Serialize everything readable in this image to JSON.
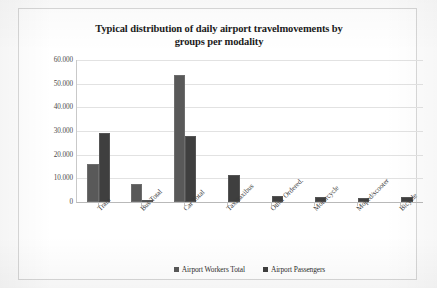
{
  "chart_data": {
    "type": "bar",
    "title": "Typical distribution of daily airport travelmovements by groups per modality",
    "title_line_1": "Typical distribution of daily airport travelmovements by",
    "title_line_2": "groups per modality",
    "xlabel": "",
    "ylabel": "",
    "ylim": [
      0,
      60000
    ],
    "grid": true,
    "legend_position": "bottom",
    "ytick_labels": [
      "0",
      "10.000",
      "20.000",
      "30.000",
      "40.000",
      "50.000",
      "60.000"
    ],
    "ytick_values": [
      0,
      10000,
      20000,
      30000,
      40000,
      50000,
      60000
    ],
    "categories": [
      "Train",
      "Bus Total",
      "Car Total",
      "Taxi/taxibus",
      "Other Ordered.",
      "Motorcycle",
      "Moped/scooter",
      "Bicycle"
    ],
    "series": [
      {
        "name": "Airport Workers Total",
        "color": "#595959",
        "values": [
          16000,
          7500,
          53500,
          0,
          0,
          0,
          0,
          0
        ]
      },
      {
        "name": "Airport Passengers",
        "color": "#3f3f3f",
        "values": [
          29000,
          1000,
          28000,
          11500,
          2400,
          2300,
          1700,
          2100
        ]
      }
    ]
  }
}
